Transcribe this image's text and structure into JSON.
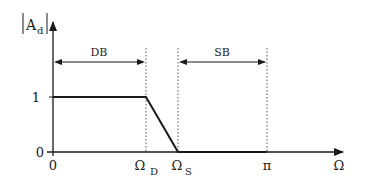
{
  "diagram": {
    "type": "lowpass-filter-magnitude-response",
    "y_axis_label": {
      "main": "A",
      "subscript": "d"
    },
    "x_axis_label": "Ω",
    "y_ticks": [
      {
        "label": "1",
        "value": 1
      },
      {
        "label": "0",
        "value": 0
      }
    ],
    "x_ticks": [
      {
        "label": "0",
        "sub": ""
      },
      {
        "label": "Ω",
        "sub": "D"
      },
      {
        "label": "Ω",
        "sub": "S"
      },
      {
        "label": "π",
        "sub": ""
      }
    ],
    "bands": [
      {
        "label": "DB",
        "from": "0",
        "to": "Ω_D"
      },
      {
        "label": "SB",
        "from": "Ω_S",
        "to": "π"
      }
    ],
    "response_points": [
      {
        "x": "0",
        "y": 1
      },
      {
        "x": "Ω_D",
        "y": 1
      },
      {
        "x": "Ω_S",
        "y": 0
      },
      {
        "x": "π",
        "y": 0
      }
    ],
    "colors": {
      "line": "#1a1a1a",
      "dotted": "#555555",
      "background": "#ffffff"
    }
  }
}
